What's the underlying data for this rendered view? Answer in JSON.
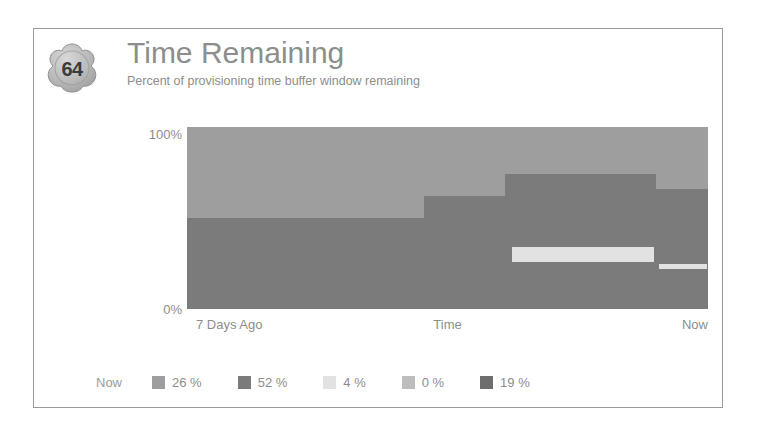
{
  "widget": {
    "score": "64",
    "title": "Time Remaining",
    "subtitle": "Percent of provisioning time buffer window remaining"
  },
  "chart_data": {
    "type": "area",
    "title": "Time Remaining",
    "subtitle": "Percent of provisioning time buffer window remaining",
    "xlabel": "Time",
    "ylabel": "",
    "ylim": [
      0,
      100
    ],
    "yticks": [
      "0%",
      "100%"
    ],
    "xticks": [
      "7 Days Ago",
      "Time",
      "Now"
    ],
    "grid": false,
    "stacked": true,
    "legend_position": "bottom",
    "legend_prefix": "Now",
    "series": [
      {
        "name": "26 %",
        "value": 26,
        "color": "#9e9e9e"
      },
      {
        "name": "52 %",
        "value": 52,
        "color": "#7b7b7b"
      },
      {
        "name": "4 %",
        "value": 4,
        "color": "#e2e2e2"
      },
      {
        "name": "0 %",
        "value": 0,
        "color": "#bdbdbd"
      },
      {
        "name": "19 %",
        "value": 19,
        "color": "#6e6e6e"
      }
    ],
    "steps": [
      {
        "x0": 0.0,
        "x1": 0.455,
        "band_top": 100,
        "band_mid": 50,
        "light_band": null
      },
      {
        "x0": 0.455,
        "x1": 0.61,
        "band_top": 100,
        "band_mid": 62,
        "light_band": null
      },
      {
        "x0": 0.61,
        "x1": 0.9,
        "band_top": 100,
        "band_mid": 74,
        "light_band": {
          "low": 26,
          "high": 34
        }
      },
      {
        "x0": 0.9,
        "x1": 1.0,
        "band_top": 100,
        "band_mid": 66,
        "light_band": {
          "low": 22,
          "high": 25
        }
      }
    ]
  },
  "axis": {
    "y_top": "100%",
    "y_bottom": "0%",
    "x_left": "7 Days Ago",
    "x_center": "Time",
    "x_right": "Now"
  },
  "legend": {
    "now_label": "Now",
    "items": [
      {
        "label": "26 %",
        "color": "#9e9e9e"
      },
      {
        "label": "52 %",
        "color": "#7b7b7b"
      },
      {
        "label": "4 %",
        "color": "#e2e2e2"
      },
      {
        "label": "0 %",
        "color": "#bdbdbd"
      },
      {
        "label": "19 %",
        "color": "#6e6e6e"
      }
    ]
  },
  "colors": {
    "frame_border": "#9a9a9a",
    "text_gray": "#8d8d8d",
    "upper_band": "#9e9e9e",
    "lower_band": "#7b7b7b",
    "light_band": "#e2e2e2"
  }
}
